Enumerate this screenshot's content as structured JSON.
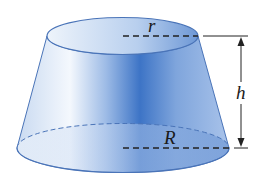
{
  "diagram": {
    "labels": {
      "top_radius": "r",
      "bottom_radius": "R",
      "height": "h"
    },
    "colors": {
      "fill_light": "#e6eff9",
      "fill_dark": "#3f78c8",
      "outline": "#4a74b8",
      "dimension_line": "#222222"
    }
  }
}
